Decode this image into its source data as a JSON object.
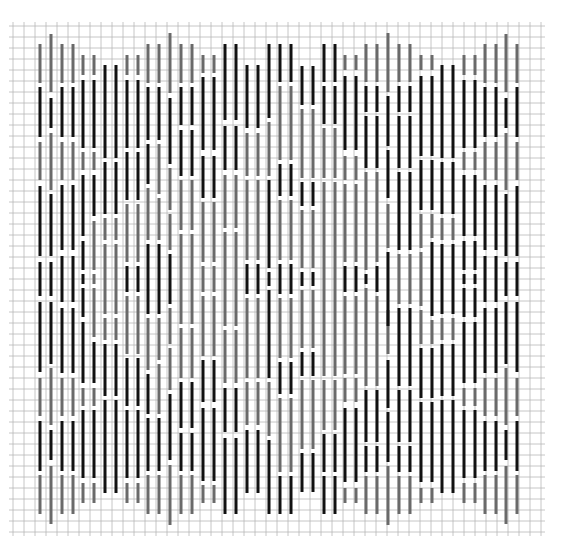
{
  "title": "Bargello stitch chart",
  "colors": {
    "background": "#ffffff",
    "grid": "#b8b8b8",
    "black": "#111111",
    "gray": "#6a6a6a"
  },
  "grid": {
    "x0": 13,
    "y0": 26,
    "cell": 11,
    "cols": 49,
    "rows": 47
  },
  "stitch_width": 3,
  "center_y": 279,
  "columns_x": [
    40,
    51,
    62,
    73,
    83,
    94,
    105,
    116,
    127,
    138,
    148,
    159,
    170,
    181,
    192,
    203,
    214,
    225,
    236,
    247,
    258,
    269,
    280,
    291,
    302,
    313,
    324,
    335,
    345,
    356,
    366,
    377,
    388,
    399,
    410,
    421,
    432,
    442,
    453,
    464,
    475,
    485,
    496,
    506,
    517
  ],
  "legend": [
    {
      "color": "black",
      "label": "dark thread"
    },
    {
      "color": "gray",
      "label": "light thread"
    }
  ],
  "top_half_segments": [
    [
      [
        44,
        83,
        "g"
      ],
      [
        87,
        137,
        "b"
      ],
      [
        142,
        180,
        "g"
      ],
      [
        186,
        256,
        "b"
      ],
      [
        262,
        296,
        "b"
      ]
    ],
    [
      [
        34,
        92,
        "g"
      ],
      [
        98,
        128,
        "b"
      ],
      [
        133,
        190,
        "g"
      ],
      [
        194,
        256,
        "b"
      ],
      [
        262,
        296,
        "b"
      ]
    ],
    [
      [
        44,
        83,
        "g"
      ],
      [
        87,
        137,
        "b"
      ],
      [
        142,
        180,
        "g"
      ],
      [
        185,
        250,
        "b"
      ],
      [
        256,
        302,
        "b"
      ]
    ],
    [
      [
        44,
        83,
        "g"
      ],
      [
        87,
        137,
        "b"
      ],
      [
        142,
        180,
        "g"
      ],
      [
        185,
        250,
        "b"
      ],
      [
        256,
        302,
        "b"
      ]
    ],
    [
      [
        55,
        75,
        "g"
      ],
      [
        80,
        148,
        "b"
      ],
      [
        152,
        170,
        "g"
      ],
      [
        175,
        236,
        "b"
      ],
      [
        241,
        270,
        "b"
      ],
      [
        274,
        284,
        "b"
      ]
    ],
    [
      [
        55,
        75,
        "g"
      ],
      [
        80,
        148,
        "b"
      ],
      [
        152,
        170,
        "g"
      ],
      [
        175,
        216,
        "b"
      ],
      [
        221,
        270,
        "g"
      ],
      [
        274,
        284,
        "g"
      ]
    ],
    [
      [
        65,
        158,
        "b"
      ],
      [
        162,
        214,
        "b"
      ],
      [
        218,
        240,
        "g"
      ],
      [
        244,
        314,
        "g"
      ]
    ],
    [
      [
        65,
        158,
        "b"
      ],
      [
        162,
        214,
        "b"
      ],
      [
        218,
        240,
        "g"
      ],
      [
        244,
        314,
        "g"
      ]
    ],
    [
      [
        55,
        75,
        "g"
      ],
      [
        80,
        148,
        "b"
      ],
      [
        152,
        200,
        "b"
      ],
      [
        204,
        262,
        "g"
      ],
      [
        266,
        292,
        "b"
      ]
    ],
    [
      [
        55,
        75,
        "g"
      ],
      [
        80,
        148,
        "b"
      ],
      [
        152,
        200,
        "b"
      ],
      [
        204,
        262,
        "g"
      ],
      [
        266,
        292,
        "b"
      ]
    ],
    [
      [
        44,
        83,
        "g"
      ],
      [
        87,
        140,
        "b"
      ],
      [
        144,
        184,
        "b"
      ],
      [
        188,
        240,
        "g"
      ],
      [
        244,
        314,
        "b"
      ]
    ],
    [
      [
        44,
        83,
        "g"
      ],
      [
        87,
        140,
        "b"
      ],
      [
        144,
        194,
        "g"
      ],
      [
        198,
        240,
        "g"
      ],
      [
        244,
        314,
        "b"
      ]
    ],
    [
      [
        33,
        93,
        "g"
      ],
      [
        98,
        164,
        "b"
      ],
      [
        168,
        210,
        "g"
      ],
      [
        214,
        250,
        "g"
      ],
      [
        254,
        304,
        "b"
      ]
    ],
    [
      [
        44,
        83,
        "g"
      ],
      [
        87,
        125,
        "b"
      ],
      [
        130,
        176,
        "b"
      ],
      [
        180,
        230,
        "g"
      ],
      [
        234,
        324,
        "g"
      ]
    ],
    [
      [
        44,
        83,
        "g"
      ],
      [
        87,
        125,
        "b"
      ],
      [
        130,
        176,
        "b"
      ],
      [
        180,
        230,
        "g"
      ],
      [
        234,
        324,
        "g"
      ]
    ],
    [
      [
        55,
        73,
        "g"
      ],
      [
        77,
        150,
        "b"
      ],
      [
        156,
        198,
        "b"
      ],
      [
        202,
        262,
        "g"
      ],
      [
        266,
        292,
        "g"
      ]
    ],
    [
      [
        55,
        73,
        "g"
      ],
      [
        77,
        150,
        "b"
      ],
      [
        156,
        198,
        "b"
      ],
      [
        202,
        262,
        "g"
      ],
      [
        266,
        292,
        "g"
      ]
    ],
    [
      [
        44,
        120,
        "b"
      ],
      [
        126,
        170,
        "b"
      ],
      [
        175,
        228,
        "g"
      ],
      [
        232,
        326,
        "g"
      ]
    ],
    [
      [
        44,
        120,
        "b"
      ],
      [
        126,
        170,
        "b"
      ],
      [
        175,
        228,
        "g"
      ],
      [
        232,
        326,
        "g"
      ]
    ],
    [
      [
        65,
        128,
        "b"
      ],
      [
        133,
        176,
        "g"
      ],
      [
        180,
        260,
        "g"
      ],
      [
        264,
        294,
        "b"
      ]
    ],
    [
      [
        65,
        128,
        "b"
      ],
      [
        133,
        176,
        "g"
      ],
      [
        180,
        260,
        "g"
      ],
      [
        264,
        294,
        "b"
      ]
    ],
    [
      [
        44,
        118,
        "b"
      ],
      [
        122,
        176,
        "g"
      ],
      [
        180,
        268,
        "b"
      ],
      [
        272,
        286,
        "b"
      ]
    ],
    [
      [
        44,
        82,
        "b"
      ],
      [
        86,
        160,
        "g"
      ],
      [
        164,
        196,
        "b"
      ],
      [
        200,
        260,
        "g"
      ],
      [
        264,
        294,
        "b"
      ]
    ],
    [
      [
        44,
        82,
        "b"
      ],
      [
        86,
        160,
        "g"
      ],
      [
        164,
        196,
        "b"
      ],
      [
        200,
        260,
        "g"
      ],
      [
        264,
        294,
        "b"
      ]
    ],
    [
      [
        66,
        105,
        "b"
      ],
      [
        109,
        178,
        "g"
      ],
      [
        182,
        206,
        "b"
      ],
      [
        210,
        268,
        "g"
      ],
      [
        272,
        286,
        "b"
      ]
    ],
    [
      [
        66,
        105,
        "b"
      ],
      [
        109,
        178,
        "g"
      ],
      [
        182,
        206,
        "b"
      ],
      [
        210,
        268,
        "g"
      ],
      [
        272,
        286,
        "b"
      ]
    ],
    [
      [
        44,
        82,
        "b"
      ],
      [
        86,
        124,
        "b"
      ],
      [
        128,
        178,
        "g"
      ],
      [
        182,
        280,
        "g"
      ]
    ],
    [
      [
        44,
        82,
        "b"
      ],
      [
        86,
        124,
        "b"
      ],
      [
        128,
        178,
        "g"
      ],
      [
        182,
        280,
        "g"
      ]
    ],
    [
      [
        55,
        70,
        "g"
      ],
      [
        76,
        150,
        "b"
      ],
      [
        156,
        180,
        "g"
      ],
      [
        184,
        262,
        "g"
      ],
      [
        266,
        292,
        "b"
      ]
    ],
    [
      [
        55,
        70,
        "g"
      ],
      [
        76,
        150,
        "b"
      ],
      [
        156,
        180,
        "g"
      ],
      [
        184,
        262,
        "g"
      ],
      [
        266,
        292,
        "b"
      ]
    ],
    [
      [
        44,
        82,
        "g"
      ],
      [
        86,
        112,
        "b"
      ],
      [
        116,
        168,
        "b"
      ],
      [
        172,
        270,
        "g"
      ],
      [
        274,
        284,
        "b"
      ]
    ],
    [
      [
        44,
        82,
        "g"
      ],
      [
        86,
        112,
        "b"
      ],
      [
        116,
        168,
        "b"
      ],
      [
        172,
        262,
        "g"
      ],
      [
        266,
        292,
        "b"
      ]
    ],
    [
      [
        33,
        92,
        "g"
      ],
      [
        96,
        146,
        "b"
      ],
      [
        150,
        198,
        "b"
      ],
      [
        204,
        248,
        "g"
      ],
      [
        252,
        326,
        "b"
      ]
    ],
    [
      [
        44,
        82,
        "g"
      ],
      [
        86,
        112,
        "b"
      ],
      [
        116,
        168,
        "b"
      ],
      [
        172,
        250,
        "b"
      ],
      [
        254,
        304,
        "g"
      ]
    ],
    [
      [
        44,
        82,
        "g"
      ],
      [
        86,
        112,
        "b"
      ],
      [
        116,
        168,
        "b"
      ],
      [
        172,
        250,
        "b"
      ],
      [
        254,
        304,
        "g"
      ]
    ],
    [
      [
        55,
        70,
        "g"
      ],
      [
        76,
        156,
        "b"
      ],
      [
        160,
        210,
        "b"
      ],
      [
        214,
        248,
        "g"
      ],
      [
        252,
        306,
        "g"
      ]
    ],
    [
      [
        55,
        70,
        "g"
      ],
      [
        76,
        156,
        "b"
      ],
      [
        160,
        210,
        "b"
      ],
      [
        214,
        238,
        "g"
      ],
      [
        242,
        316,
        "b"
      ]
    ],
    [
      [
        65,
        158,
        "b"
      ],
      [
        162,
        214,
        "b"
      ],
      [
        218,
        240,
        "g"
      ],
      [
        244,
        314,
        "b"
      ]
    ],
    [
      [
        65,
        158,
        "b"
      ],
      [
        162,
        214,
        "b"
      ],
      [
        218,
        240,
        "g"
      ],
      [
        244,
        314,
        "b"
      ]
    ],
    [
      [
        55,
        75,
        "g"
      ],
      [
        80,
        148,
        "b"
      ],
      [
        152,
        170,
        "g"
      ],
      [
        175,
        236,
        "b"
      ],
      [
        241,
        270,
        "b"
      ],
      [
        274,
        284,
        "b"
      ]
    ],
    [
      [
        55,
        75,
        "g"
      ],
      [
        80,
        148,
        "b"
      ],
      [
        152,
        170,
        "g"
      ],
      [
        175,
        236,
        "b"
      ],
      [
        241,
        270,
        "b"
      ],
      [
        274,
        284,
        "b"
      ]
    ],
    [
      [
        44,
        83,
        "g"
      ],
      [
        87,
        137,
        "b"
      ],
      [
        142,
        180,
        "g"
      ],
      [
        185,
        250,
        "b"
      ],
      [
        256,
        302,
        "b"
      ]
    ],
    [
      [
        44,
        83,
        "g"
      ],
      [
        87,
        137,
        "b"
      ],
      [
        142,
        180,
        "g"
      ],
      [
        185,
        250,
        "b"
      ],
      [
        256,
        302,
        "b"
      ]
    ],
    [
      [
        34,
        92,
        "g"
      ],
      [
        98,
        128,
        "b"
      ],
      [
        133,
        190,
        "g"
      ],
      [
        194,
        256,
        "b"
      ],
      [
        262,
        296,
        "b"
      ]
    ],
    [
      [
        44,
        83,
        "g"
      ],
      [
        87,
        137,
        "b"
      ],
      [
        142,
        180,
        "g"
      ],
      [
        186,
        256,
        "b"
      ],
      [
        262,
        296,
        "b"
      ]
    ]
  ]
}
